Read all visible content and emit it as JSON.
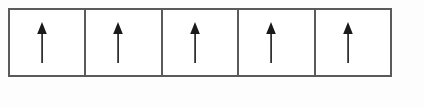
{
  "diagram": {
    "cell_count": 5,
    "border_color": "#5a5a5a",
    "cell_fill": "#ffffff",
    "page_background": "#fdfdfd",
    "arrow_color": "#1a1a1a",
    "arrow_direction": "up",
    "cells": [
      {
        "index": "1",
        "arrow": "up-arrow",
        "state": "up"
      },
      {
        "index": "2",
        "arrow": "up-arrow",
        "state": "up"
      },
      {
        "index": "3",
        "arrow": "up-arrow",
        "state": "up"
      },
      {
        "index": "4",
        "arrow": "up-arrow",
        "state": "up"
      },
      {
        "index": "5",
        "arrow": "up-arrow",
        "state": "up"
      }
    ]
  }
}
